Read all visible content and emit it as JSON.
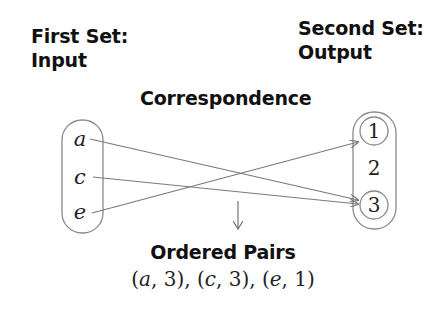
{
  "first_set": {
    "title_line1": "First Set:",
    "title_line2": "Input",
    "elements": [
      "a",
      "c",
      "e"
    ]
  },
  "second_set": {
    "title_line1": "Second Set:",
    "title_line2": "Output",
    "elements": [
      "1",
      "2",
      "3"
    ],
    "highlighted": [
      "1",
      "3"
    ]
  },
  "correspondence": {
    "label": "Correspondence",
    "mappings": [
      {
        "from": "a",
        "to": "3"
      },
      {
        "from": "c",
        "to": "3"
      },
      {
        "from": "e",
        "to": "1"
      }
    ]
  },
  "ordered_pairs": {
    "label": "Ordered Pairs",
    "pairs": [
      {
        "x": "a",
        "y": "3"
      },
      {
        "x": "c",
        "y": "3"
      },
      {
        "x": "e",
        "y": "1"
      }
    ]
  },
  "colors": {
    "text": "#111111",
    "line": "#7a7a7a",
    "outline": "#8a8a8a"
  }
}
